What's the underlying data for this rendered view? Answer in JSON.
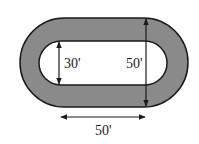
{
  "diagram": {
    "title": "",
    "colors": {
      "track_fill": "#8a8a8a",
      "inner_fill": "#ffffff",
      "stroke": "#1a1a1a"
    },
    "shapes": {
      "outer": {
        "x": 20,
        "y": 18,
        "width": 168,
        "height": 89
      },
      "inner": {
        "x": 39,
        "y": 41,
        "width": 128,
        "height": 44
      }
    },
    "labels": {
      "inner_width": "30'",
      "outer_width": "50'",
      "straight_length": "50'"
    },
    "dimensions": [
      {
        "name": "inner-width",
        "value": "30'",
        "orientation": "vertical"
      },
      {
        "name": "outer-width",
        "value": "50'",
        "orientation": "vertical"
      },
      {
        "name": "straight-length",
        "value": "50'",
        "orientation": "horizontal"
      }
    ]
  }
}
